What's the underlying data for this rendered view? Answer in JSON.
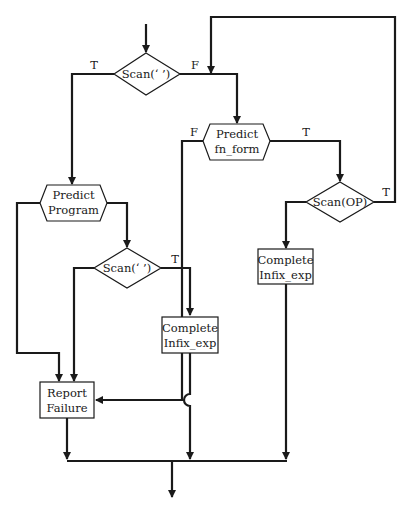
{
  "diagram": {
    "type": "flowchart",
    "nodes": {
      "scan_blank_top": {
        "shape": "decision",
        "label": "Scan(‘ ’)"
      },
      "predict_fn_form": {
        "shape": "hexagon",
        "line1": "Predict",
        "line2": "fn_form"
      },
      "scan_op": {
        "shape": "decision",
        "label": "Scan(OP)"
      },
      "complete_infix_right": {
        "shape": "process",
        "line1": "Complete",
        "line2": "Infix_exp"
      },
      "predict_program": {
        "shape": "hexagon",
        "line1": "Predict",
        "line2": "Program"
      },
      "scan_blank_mid": {
        "shape": "decision",
        "label": "Scan(‘ ’)"
      },
      "complete_infix_mid": {
        "shape": "process",
        "line1": "Complete",
        "line2": "Infix_exp"
      },
      "report_failure": {
        "shape": "process",
        "line1": "Report",
        "line2": "Failure"
      }
    },
    "edge_labels": {
      "scan_top_true": "T",
      "scan_top_false": "F",
      "fn_form_false": "F",
      "fn_form_true": "T",
      "scan_op_true": "T",
      "scan_mid_true": "T"
    },
    "edges": [
      {
        "from": "entry",
        "to": "scan_blank_top"
      },
      {
        "from": "scan_blank_top",
        "to": "predict_program",
        "label": "T"
      },
      {
        "from": "scan_blank_top",
        "to": "predict_fn_form",
        "label": "F"
      },
      {
        "from": "predict_fn_form",
        "to": "scan_op",
        "label": "T"
      },
      {
        "from": "predict_fn_form",
        "to": "report_failure",
        "label": "F"
      },
      {
        "from": "scan_op",
        "to": "predict_fn_form",
        "label": "T"
      },
      {
        "from": "scan_op",
        "to": "complete_infix_right",
        "label": ""
      },
      {
        "from": "complete_infix_right",
        "to": "exit"
      },
      {
        "from": "predict_program",
        "to": "scan_blank_mid"
      },
      {
        "from": "predict_program",
        "to": "report_failure"
      },
      {
        "from": "scan_blank_mid",
        "to": "complete_infix_mid",
        "label": "T"
      },
      {
        "from": "scan_blank_mid",
        "to": "report_failure",
        "label": ""
      },
      {
        "from": "complete_infix_mid",
        "to": "exit"
      },
      {
        "from": "report_failure",
        "to": "exit"
      }
    ]
  }
}
